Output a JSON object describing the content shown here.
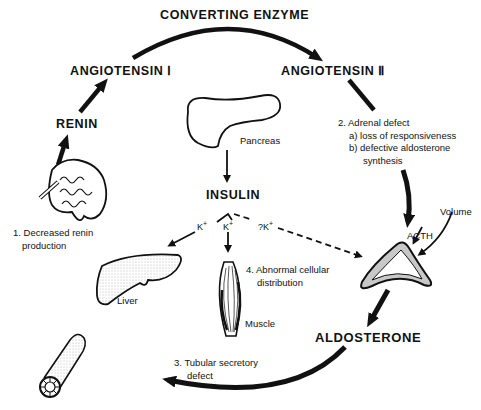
{
  "diagram": {
    "nodes": {
      "converting_enzyme": "CONVERTING ENZYME",
      "angiotensin_1": "ANGIOTENSIN Ⅰ",
      "angiotensin_2": "ANGIOTENSIN Ⅱ",
      "renin": "RENIN",
      "insulin": "INSULIN",
      "aldosterone": "ALDOSTERONE"
    },
    "organs": {
      "pancreas": "Pancreas",
      "liver": "Liver",
      "muscle": "Muscle",
      "acth": "ACTH",
      "volume": "Volume"
    },
    "potassium": {
      "k_liver": "K",
      "k_muscle": "K",
      "k_adrenal": "?K",
      "plus": "+"
    },
    "defects": {
      "d1_line1": "1. Decreased renin",
      "d1_line2": "production",
      "d2_line1": "2. Adrenal defect",
      "d2_a": "a) loss of responsiveness",
      "d2_b": "b) defective aldosterone",
      "d2_b2": "synthesis",
      "d3_line1": "3. Tubular secretory",
      "d3_line2": "defect",
      "d4_line1": "4. Abnormal cellular",
      "d4_line2": "distribution"
    },
    "colors": {
      "ink": "#111111",
      "background": "#ffffff",
      "shade": "#9a9a9a"
    }
  }
}
